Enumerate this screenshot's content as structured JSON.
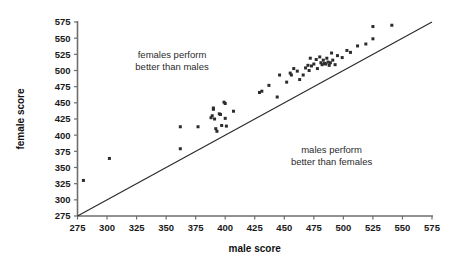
{
  "chart_data": {
    "type": "scatter",
    "title": "",
    "xlabel": "male score",
    "ylabel": "female score",
    "xlim": [
      275,
      575
    ],
    "ylim": [
      275,
      575
    ],
    "xticks": [
      275,
      300,
      325,
      350,
      375,
      400,
      425,
      450,
      475,
      500,
      525,
      550,
      575
    ],
    "yticks": [
      275,
      300,
      325,
      350,
      375,
      400,
      425,
      450,
      475,
      500,
      525,
      550,
      575
    ],
    "grid": false,
    "legend": "none",
    "reference_line": {
      "name": "y = x identity line",
      "from": [
        275,
        275
      ],
      "to": [
        575,
        575
      ]
    },
    "annotations": [
      {
        "name": "females-perform-better",
        "lines": [
          "females perform",
          "better than males"
        ],
        "x": 355,
        "y": 520
      },
      {
        "name": "males-perform-better",
        "lines": [
          "males perform",
          "better than females"
        ],
        "x": 490,
        "y": 372
      }
    ],
    "marker": {
      "shape": "square",
      "size": 3,
      "color": "#2c2c2c"
    },
    "points": [
      [
        280,
        330
      ],
      [
        302,
        364
      ],
      [
        362,
        413
      ],
      [
        362,
        379
      ],
      [
        377,
        413
      ],
      [
        388,
        427
      ],
      [
        389,
        430
      ],
      [
        390,
        440
      ],
      [
        390,
        442
      ],
      [
        391,
        425
      ],
      [
        392,
        410
      ],
      [
        393,
        406
      ],
      [
        395,
        433
      ],
      [
        396,
        432
      ],
      [
        397,
        415
      ],
      [
        399,
        451
      ],
      [
        400,
        449
      ],
      [
        400,
        426
      ],
      [
        401,
        414
      ],
      [
        407,
        437
      ],
      [
        429,
        466
      ],
      [
        431,
        468
      ],
      [
        437,
        477
      ],
      [
        444,
        459
      ],
      [
        446,
        493
      ],
      [
        452,
        482
      ],
      [
        455,
        496
      ],
      [
        456,
        493
      ],
      [
        458,
        503
      ],
      [
        461,
        499
      ],
      [
        463,
        486
      ],
      [
        466,
        493
      ],
      [
        468,
        504
      ],
      [
        470,
        508
      ],
      [
        471,
        500
      ],
      [
        472,
        519
      ],
      [
        473,
        507
      ],
      [
        475,
        510
      ],
      [
        477,
        517
      ],
      [
        478,
        503
      ],
      [
        480,
        521
      ],
      [
        481,
        512
      ],
      [
        482,
        509
      ],
      [
        483,
        516
      ],
      [
        484,
        511
      ],
      [
        485,
        510
      ],
      [
        486,
        519
      ],
      [
        487,
        513
      ],
      [
        488,
        508
      ],
      [
        489,
        512
      ],
      [
        490,
        527
      ],
      [
        491,
        516
      ],
      [
        493,
        509
      ],
      [
        495,
        523
      ],
      [
        499,
        520
      ],
      [
        503,
        531
      ],
      [
        506,
        528
      ],
      [
        512,
        538
      ],
      [
        519,
        541
      ],
      [
        525,
        568
      ],
      [
        525,
        549
      ],
      [
        541,
        570
      ]
    ]
  },
  "axes": {
    "x_title": "male score",
    "y_title": "female score"
  }
}
